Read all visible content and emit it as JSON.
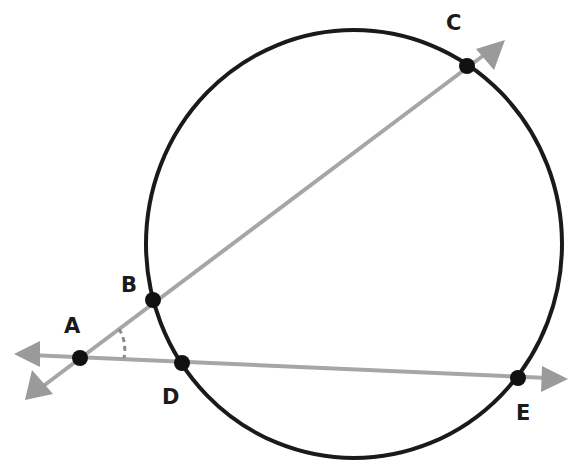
{
  "diagram": {
    "type": "geometry-secants",
    "circle": {
      "cx": 354,
      "cy": 244,
      "r": 211,
      "stroke": "#1a1a1a"
    },
    "line_color": "#a6a6a6",
    "point_color": "#111111",
    "points": [
      {
        "id": "A",
        "label": "A",
        "x": 80,
        "y": 358,
        "label_x": 64,
        "label_y": 316
      },
      {
        "id": "B",
        "label": "B",
        "x": 153,
        "y": 300,
        "label_x": 121,
        "label_y": 275
      },
      {
        "id": "C",
        "label": "C",
        "x": 467,
        "y": 66,
        "label_x": 446,
        "label_y": 13
      },
      {
        "id": "D",
        "label": "D",
        "x": 182,
        "y": 363,
        "label_x": 162,
        "label_y": 387
      },
      {
        "id": "E",
        "label": "E",
        "x": 518,
        "y": 378,
        "label_x": 516,
        "label_y": 403
      }
    ],
    "rays": [
      {
        "id": "ray-AC",
        "through": [
          "B",
          "C"
        ],
        "from": [
          25,
          400
        ],
        "to": [
          505,
          40
        ]
      },
      {
        "id": "ray-AE",
        "through": [
          "D",
          "E"
        ],
        "from": [
          14,
          354
        ],
        "to": [
          568,
          379
        ]
      }
    ],
    "angle_mark": {
      "vertex": "A",
      "between": [
        "ray-AC",
        "ray-AE"
      ],
      "style": "dashed-arc"
    }
  }
}
